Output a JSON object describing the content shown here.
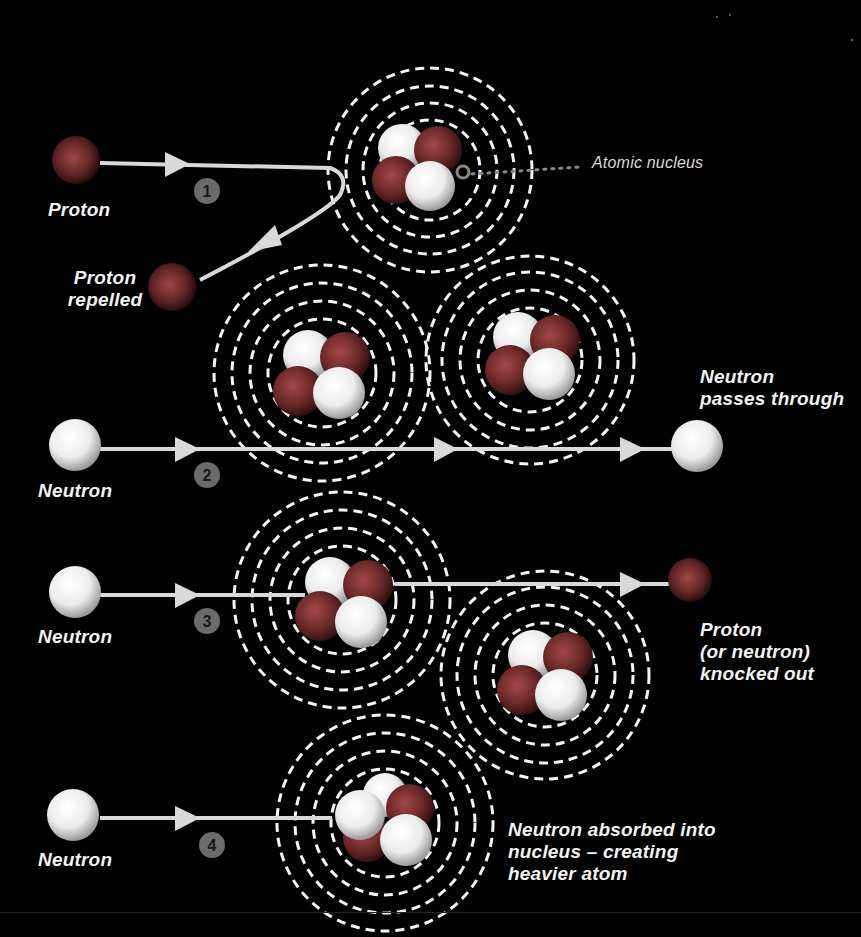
{
  "diagram": {
    "type": "nuclear-interaction-diagram",
    "colors": {
      "background": "#020202",
      "proton": "#7a2f2f",
      "neutron": "#f2f2f2",
      "path": "#d9d9d9",
      "orbit": "#f5f5f5",
      "step_badge": "#6b6b6b",
      "callout_dots": "#888888"
    },
    "labels": {
      "atomic_nucleus": "Atomic nucleus",
      "proton_1": "Proton",
      "proton_repelled_line1": "Proton",
      "proton_repelled_line2": "repelled",
      "neutron_2": "Neutron",
      "neutron_passes_line1": "Neutron",
      "neutron_passes_line2": "passes through",
      "neutron_3": "Neutron",
      "knocked_out_line1": "Proton",
      "knocked_out_line2": "(or neutron)",
      "knocked_out_line3": "knocked out",
      "neutron_4": "Neutron",
      "absorbed_line1": "Neutron absorbed into",
      "absorbed_line2": "nucleus – creating",
      "absorbed_line3": "heavier atom"
    },
    "steps": [
      {
        "number": "1",
        "description": "Proton approaches atom and is repelled"
      },
      {
        "number": "2",
        "description": "Neutron passes through atoms"
      },
      {
        "number": "3",
        "description": "Neutron knocks out a proton (or neutron)"
      },
      {
        "number": "4",
        "description": "Neutron absorbed into nucleus creating heavier atom"
      }
    ],
    "atoms": [
      {
        "id": "atom-top",
        "cx": 430,
        "cy": 170
      },
      {
        "id": "atom-mid-left",
        "cx": 322,
        "cy": 373
      },
      {
        "id": "atom-mid-right",
        "cx": 530,
        "cy": 360
      },
      {
        "id": "atom-row3-left",
        "cx": 342,
        "cy": 600
      },
      {
        "id": "atom-row3-right",
        "cx": 545,
        "cy": 675
      },
      {
        "id": "atom-bottom",
        "cx": 385,
        "cy": 823
      }
    ]
  }
}
